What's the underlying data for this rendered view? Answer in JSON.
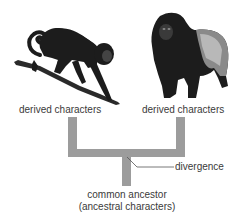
{
  "diagram": {
    "type": "evolutionary-divergence-tree",
    "organisms": [
      {
        "name": "monkey",
        "label": "derived characters"
      },
      {
        "name": "gorilla",
        "label": "derived characters"
      }
    ],
    "branch_point_label": "divergence",
    "root_label_line1": "common ancestor",
    "root_label_line2": "(ancestral characters)",
    "colors": {
      "tree": "#9c9c9c",
      "text": "#3a3a3a",
      "leader_line": "#555555",
      "silhouette": "#1c1c1c"
    }
  }
}
